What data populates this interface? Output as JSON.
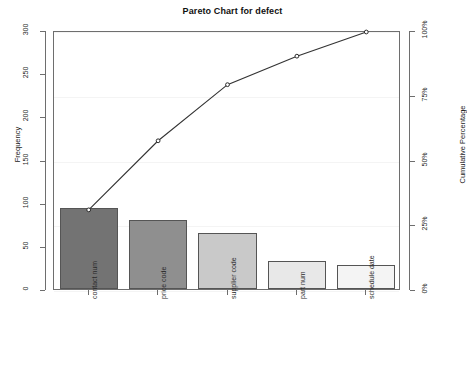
{
  "chart_data": {
    "type": "bar",
    "title": "Pareto Chart for defect",
    "xlabel": "",
    "ylabel": "Frequency",
    "y2label": "Cumulative Percentage",
    "categories": [
      "contact num",
      "price code",
      "supplier code",
      "part num",
      "schedule date"
    ],
    "values": [
      94,
      80,
      65,
      33,
      28
    ],
    "cumulative_values": [
      94,
      174,
      239,
      272,
      300
    ],
    "cumulative_percent": [
      31.3,
      58.0,
      79.7,
      90.7,
      100.0
    ],
    "ylim": [
      0,
      300
    ],
    "yticks": [
      0,
      50,
      100,
      150,
      200,
      250,
      300
    ],
    "ytick_labels": [
      "0",
      "50",
      "100",
      "150",
      "200",
      "250",
      "300"
    ],
    "y2lim": [
      0,
      100
    ],
    "y2ticks": [
      0,
      25,
      50,
      75,
      100
    ],
    "y2tick_labels": [
      "0%",
      "25%",
      "50%",
      "75%",
      "100%"
    ],
    "grid": true,
    "legend": "none",
    "bar_colors": [
      "#737373",
      "#8f8f8f",
      "#c9c9c9",
      "#e8e8e8",
      "#f4f4f4"
    ],
    "bar_border_color": "#555555",
    "line_color": "#333333",
    "marker": "open-circle"
  }
}
